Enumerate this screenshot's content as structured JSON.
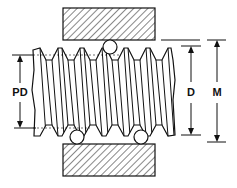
{
  "diagram": {
    "labels": {
      "pitch_diameter": "PD",
      "major_diameter": "D",
      "measurement_over_wires": "M"
    },
    "colors": {
      "line": "#111111",
      "background": "#ffffff"
    }
  }
}
